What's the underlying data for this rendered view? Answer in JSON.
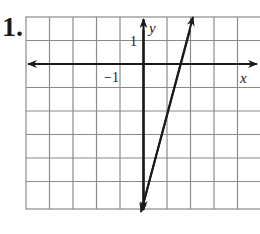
{
  "problem": {
    "number": "1."
  },
  "graph": {
    "x_axis_label": "x",
    "y_axis_label": "y",
    "tick_labels": {
      "x_minus_1": "−1",
      "y_1": "1"
    },
    "grid": {
      "x_range": [
        -5,
        5
      ],
      "y_range": [
        -6,
        2
      ],
      "cell_size_px": 23.5
    },
    "line": {
      "equation": "y = 4x - 6",
      "x_intercept": 1.5,
      "y_intercept": -6
    },
    "colors": {
      "grid": "#8a8a8a",
      "axis": "#1a1a1a",
      "line": "#1a1a1a"
    }
  }
}
